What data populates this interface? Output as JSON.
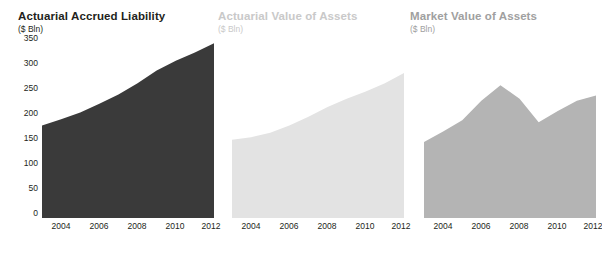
{
  "chart_data": [
    {
      "type": "area",
      "title": "Actuarial Accrued Liability",
      "subtitle": "($ Bln)",
      "xlabel": "",
      "ylabel": "",
      "x": [
        2003,
        2004,
        2005,
        2006,
        2007,
        2008,
        2009,
        2010,
        2011,
        2012
      ],
      "values": [
        180,
        192,
        205,
        222,
        240,
        262,
        287,
        306,
        322,
        340
      ],
      "ylim": [
        0,
        350
      ],
      "yticks": [
        0,
        50,
        100,
        150,
        200,
        250,
        300,
        350
      ],
      "xticks": [
        2004,
        2006,
        2008,
        2010,
        2012
      ],
      "xticklabels": [
        "2004",
        "2006",
        "2008",
        "2010",
        "2012"
      ],
      "yticklabels": [
        "0",
        "50",
        "100",
        "150",
        "200",
        "250",
        "300",
        "350"
      ],
      "fill_color": "#3a3a3a",
      "title_color": "#231f20",
      "grid": false,
      "legend": "none"
    },
    {
      "type": "area",
      "title": "Actuarial Value of Assets",
      "subtitle": "($ Bln)",
      "xlabel": "",
      "ylabel": "",
      "x": [
        2003,
        2004,
        2005,
        2006,
        2007,
        2008,
        2009,
        2010,
        2011,
        2012
      ],
      "values": [
        152,
        157,
        166,
        180,
        197,
        216,
        232,
        246,
        262,
        282
      ],
      "ylim": [
        0,
        350
      ],
      "yticks": [
        0,
        50,
        100,
        150,
        200,
        250,
        300,
        350
      ],
      "xticks": [
        2004,
        2006,
        2008,
        2010,
        2012
      ],
      "xticklabels": [
        "2004",
        "2006",
        "2008",
        "2010",
        "2012"
      ],
      "yticklabels": [
        "",
        "",
        "",
        "",
        "",
        "",
        "",
        ""
      ],
      "fill_color": "#e3e3e3",
      "title_color": "#c9c9c9",
      "grid": false,
      "legend": "none"
    },
    {
      "type": "area",
      "title": "Market Value of Assets",
      "subtitle": "($ Bln)",
      "xlabel": "",
      "ylabel": "",
      "x": [
        2003,
        2004,
        2005,
        2006,
        2007,
        2008,
        2009,
        2010,
        2011,
        2012
      ],
      "values": [
        148,
        168,
        190,
        228,
        258,
        232,
        186,
        208,
        228,
        238
      ],
      "ylim": [
        0,
        350
      ],
      "yticks": [
        0,
        50,
        100,
        150,
        200,
        250,
        300,
        350
      ],
      "xticks": [
        2004,
        2006,
        2008,
        2010,
        2012
      ],
      "xticklabels": [
        "2004",
        "2006",
        "2008",
        "2010",
        "2012"
      ],
      "yticklabels": [
        "",
        "",
        "",
        "",
        "",
        "",
        "",
        ""
      ],
      "fill_color": "#b4b4b4",
      "title_color": "#a0a0a0",
      "grid": false,
      "legend": "none"
    }
  ],
  "panels": [
    {
      "title": "Actuarial Accrued Liability",
      "subtitle": "($ Bln)",
      "yticklabels": [
        "350",
        "300",
        "250",
        "200",
        "150",
        "100",
        "50",
        "0"
      ],
      "xticklabels": [
        "2004",
        "2006",
        "2008",
        "2010",
        "2012"
      ]
    },
    {
      "title": "Actuarial Value of Assets",
      "subtitle": "($ Bln)",
      "yticklabels": [],
      "xticklabels": [
        "2004",
        "2006",
        "2008",
        "2010",
        "2012"
      ]
    },
    {
      "title": "Market Value of Assets",
      "subtitle": "($ Bln)",
      "yticklabels": [],
      "xticklabels": [
        "2004",
        "2006",
        "2008",
        "2010",
        "2012"
      ]
    }
  ]
}
